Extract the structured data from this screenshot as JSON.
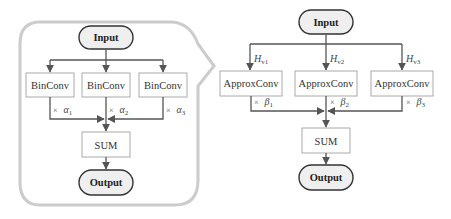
{
  "diagram": {
    "left": {
      "input": "Input",
      "branches": [
        {
          "label": "BinConv",
          "scale_prefix": "×",
          "scale_sym": "α",
          "scale_sub": "1"
        },
        {
          "label": "BinConv",
          "scale_prefix": "×",
          "scale_sym": "α",
          "scale_sub": "2"
        },
        {
          "label": "BinConv",
          "scale_prefix": "×",
          "scale_sym": "α",
          "scale_sub": "3"
        }
      ],
      "sum": "SUM",
      "output": "Output"
    },
    "right": {
      "input": "Input",
      "branches": [
        {
          "label": "ApproxConv",
          "in_sym": "H",
          "in_sub": "v1",
          "scale_prefix": "×",
          "scale_sym": "β",
          "scale_sub": "1"
        },
        {
          "label": "ApproxConv",
          "in_sym": "H",
          "in_sub": "v2",
          "scale_prefix": "×",
          "scale_sym": "β",
          "scale_sub": "2"
        },
        {
          "label": "ApproxConv",
          "in_sym": "H",
          "in_sub": "v3",
          "scale_prefix": "×",
          "scale_sym": "β",
          "scale_sub": "3"
        }
      ],
      "sum": "SUM",
      "output": "Output"
    },
    "colors": {
      "wire": "#555555",
      "box_border": "#aaaaaa",
      "terminal_fill": "#efefef",
      "terminal_border": "#333333",
      "callout_outline": "#cccccc"
    }
  }
}
